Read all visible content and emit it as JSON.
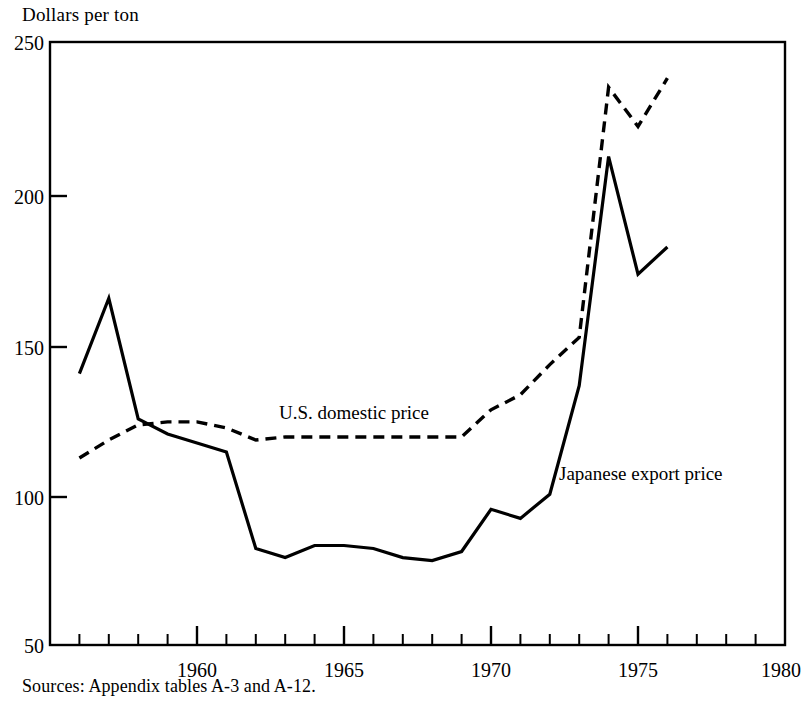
{
  "figure": {
    "y_axis_title": "Dollars per ton",
    "source_note": "Sources:  Appendix tables A-3 and A-12."
  },
  "labels": {
    "us_domestic": "U.S. domestic price",
    "japanese_export": "Japanese export price"
  },
  "yticks": [
    "250",
    "200",
    "150",
    "100",
    "50"
  ],
  "xticks": [
    "1960",
    "1965",
    "1970",
    "1975",
    "1980"
  ],
  "chart_data": {
    "type": "line",
    "title": "",
    "xlabel": "",
    "ylabel": "Dollars per ton",
    "xlim": [
      1955,
      1980
    ],
    "ylim": [
      50,
      250
    ],
    "ytick_values": [
      250,
      200,
      150,
      100,
      50
    ],
    "xtick_values": [
      1960,
      1965,
      1970,
      1975,
      1980
    ],
    "minor_xtick_interval": 1,
    "grid": false,
    "legend": "inline-annotations",
    "x": [
      1956,
      1957,
      1958,
      1959,
      1960,
      1961,
      1962,
      1963,
      1964,
      1965,
      1966,
      1967,
      1968,
      1969,
      1970,
      1971,
      1972,
      1973,
      1974,
      1975,
      1976
    ],
    "series": [
      {
        "name": "U.S. domestic price",
        "style": "dashed",
        "color": "#000000",
        "values": [
          112,
          118,
          123,
          124,
          124,
          122,
          118,
          119,
          119,
          119,
          119,
          119,
          119,
          119,
          128,
          133,
          143,
          152,
          235,
          222,
          238
        ]
      },
      {
        "name": "Japanese export price",
        "style": "solid",
        "color": "#000000",
        "values": [
          140,
          165,
          125,
          120,
          117,
          114,
          82,
          79,
          83,
          83,
          82,
          79,
          78,
          81,
          95,
          92,
          100,
          136,
          212,
          173,
          182
        ]
      }
    ]
  }
}
